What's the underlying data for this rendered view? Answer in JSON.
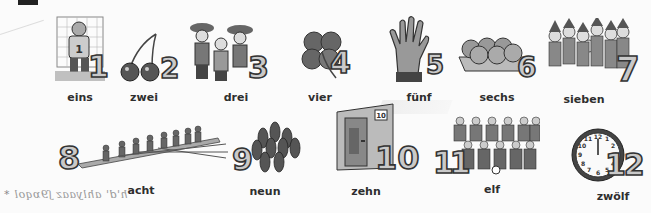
{
  "page": {
    "type": "vocabulary-illustration",
    "topic": "German numbers 1-12"
  },
  "numbers": [
    {
      "digit": "1",
      "word": "eins",
      "illustration": "goalkeeper-icon"
    },
    {
      "digit": "2",
      "word": "zwei",
      "illustration": "cherries-icon"
    },
    {
      "digit": "3",
      "word": "drei",
      "illustration": "three-musketeers-icon"
    },
    {
      "digit": "4",
      "word": "vier",
      "illustration": "four-leaf-clover-icon"
    },
    {
      "digit": "5",
      "word": "fünf",
      "illustration": "hand-icon"
    },
    {
      "digit": "6",
      "word": "sechs",
      "illustration": "egg-carton-icon"
    },
    {
      "digit": "7",
      "word": "sieben",
      "illustration": "seven-dwarfs-icon"
    },
    {
      "digit": "8",
      "word": "acht",
      "illustration": "rowing-boat-icon"
    },
    {
      "digit": "9",
      "word": "neun",
      "illustration": "bowling-pins-icon"
    },
    {
      "digit": "10",
      "word": "zehn",
      "illustration": "door-icon"
    },
    {
      "digit": "11",
      "word": "elf",
      "illustration": "football-team-icon"
    },
    {
      "digit": "12",
      "word": "zwölf",
      "illustration": "clock-icon"
    }
  ],
  "annotations": {
    "handwriting": "h'd' ahlyaaz ʃ9ɒqol",
    "star": "*"
  }
}
